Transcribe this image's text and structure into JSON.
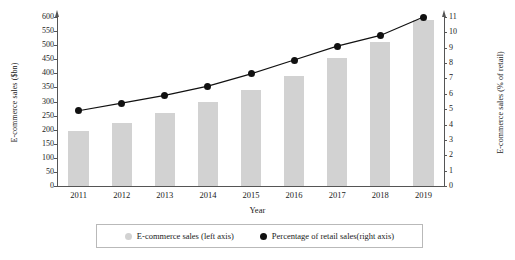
{
  "chart_data": {
    "type": "bar",
    "title": "",
    "xlabel": "Year",
    "ylabel": "E-commerce sales ($bn)",
    "y2label": "E-commerce sales (% of retail)",
    "categories": [
      "2011",
      "2012",
      "2013",
      "2014",
      "2015",
      "2016",
      "2017",
      "2018",
      "2019"
    ],
    "ylim": [
      0,
      600
    ],
    "y2lim": [
      0,
      11
    ],
    "yticks": [
      0,
      50,
      100,
      150,
      200,
      250,
      300,
      350,
      400,
      450,
      500,
      550,
      600
    ],
    "y2ticks": [
      0,
      1,
      2,
      3,
      4,
      5,
      6,
      7,
      8,
      9,
      10,
      11
    ],
    "grid": false,
    "legend_position": "bottom",
    "series": [
      {
        "name": "E-commerce sales (left axis)",
        "type": "bar",
        "axis": "left",
        "color": "#d2d2d2",
        "values": [
          195,
          225,
          258,
          300,
          342,
          390,
          453,
          512,
          590
        ]
      },
      {
        "name": "Percentage of retail sales(right axis)",
        "type": "line",
        "axis": "right",
        "color": "#111111",
        "values": [
          4.9,
          5.4,
          5.9,
          6.5,
          7.3,
          8.2,
          9.1,
          9.8,
          11.0
        ]
      }
    ]
  },
  "axes": {
    "left_title": "E-commerce sales ($bn)",
    "right_title": "E-commerce sales (% of retail)",
    "x_title": "Year"
  },
  "legend": {
    "items": [
      {
        "label": "E-commerce sales (left axis)",
        "marker": "bar-swatch-icon"
      },
      {
        "label": "Percentage of retail sales(right axis)",
        "marker": "line-dot-icon"
      }
    ]
  }
}
